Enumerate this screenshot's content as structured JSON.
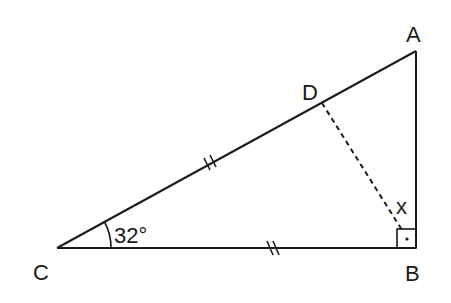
{
  "figure": {
    "type": "right-triangle geometry diagram",
    "vertices": {
      "A": "A",
      "B": "B",
      "C": "C",
      "D": "D"
    },
    "angle_label": "32°",
    "angle_value_deg": 32,
    "unknown_label": "x",
    "segments": [
      {
        "name": "CA",
        "style": "solid",
        "tick_marks": 2
      },
      {
        "name": "CB",
        "style": "solid",
        "tick_marks": 2
      },
      {
        "name": "AB",
        "style": "solid",
        "tick_marks": 0
      },
      {
        "name": "DB",
        "style": "dashed",
        "tick_marks": 0
      }
    ],
    "right_angle_at": "B",
    "equal_segments": [
      "CD",
      "CB"
    ],
    "colors": {
      "stroke": "#1a1a1a",
      "background": "#ffffff"
    }
  }
}
